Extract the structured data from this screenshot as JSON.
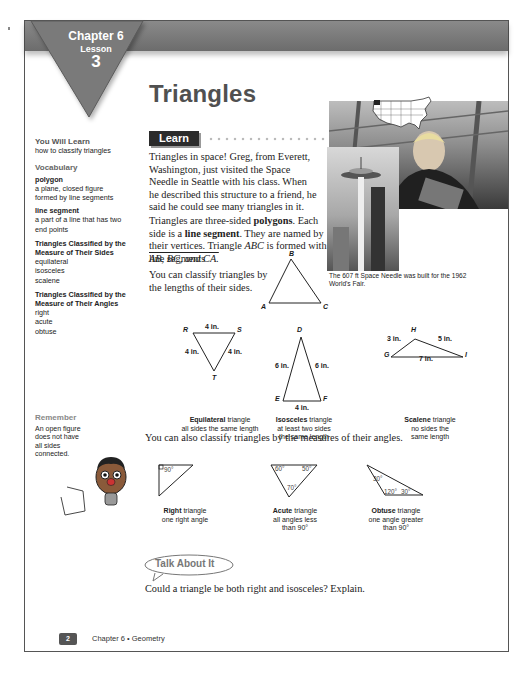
{
  "header": {
    "chapter": "Chapter 6",
    "lesson_label": "Lesson",
    "lesson_number": "3",
    "title": "Triangles"
  },
  "sidebar": {
    "will_learn_heading": "You Will Learn",
    "will_learn_text": "how to classify triangles",
    "vocab_heading": "Vocabulary",
    "terms": [
      {
        "term": "polygon",
        "definition": "a plane, closed figure formed by line segments"
      },
      {
        "term": "line segment",
        "definition": "a part of a line that has two end points"
      }
    ],
    "groups": [
      {
        "heading": "Triangles Classified by the Measure of Their Sides",
        "items": [
          "equilateral",
          "isosceles",
          "scalene"
        ]
      },
      {
        "heading": "Triangles Classified by the Measure of Their Angles",
        "items": [
          "right",
          "acute",
          "obtuse"
        ]
      }
    ],
    "remember_heading": "Remember",
    "remember_text": "An open figure does not have all sides connected."
  },
  "learn": {
    "label": "Learn",
    "para1": "Triangles in space! Greg, from Everett, Washington, just visited the Space Needle in Seattle with his class. When he described this structure to a friend, he said he could see many triangles in it.",
    "para2_a": "Triangles are three-sided ",
    "para2_b": "polygons",
    "para2_c": ". Each side is a ",
    "para2_d": "line segment",
    "para2_e": ". They are named by their vertices. Triangle ",
    "para2_f": "ABC",
    "para2_g": " is formed with line segments",
    "segments": "AB, BC, and CA.",
    "para3": "You can classify triangles by the lengths of their sides.",
    "photo_caption": "The 607 ft Space Needle was built for the 1962 World's Fair."
  },
  "triangle_abc": {
    "a": "A",
    "b": "B",
    "c": "C"
  },
  "side_triangles": [
    {
      "name": "Equilateral",
      "desc1": " triangle",
      "desc2": "all sides the same length",
      "vertices": [
        "R",
        "S",
        "T"
      ],
      "sides": [
        "4 in.",
        "4 in.",
        "4 in."
      ]
    },
    {
      "name": "Isosceles",
      "desc1": " triangle",
      "desc2": "at least two sides",
      "desc3": "the same length",
      "vertices": [
        "D",
        "E",
        "F"
      ],
      "sides": [
        "6 in.",
        "6 in.",
        "4 in."
      ]
    },
    {
      "name": "Scalene",
      "desc1": " triangle",
      "desc2": "no sides the",
      "desc3": "same length",
      "vertices": [
        "H",
        "G",
        "I"
      ],
      "sides": [
        "3 in.",
        "5 in.",
        "7 in."
      ]
    }
  ],
  "angles_intro": "You can also classify triangles by the measures of their angles.",
  "angle_triangles": [
    {
      "name": "Right",
      "desc1": " triangle",
      "desc2": "one right angle",
      "angles": [
        "90°"
      ]
    },
    {
      "name": "Acute",
      "desc1": " triangle",
      "desc2": "all angles less",
      "desc3": "than 90°",
      "angles": [
        "60°",
        "50°",
        "70°"
      ]
    },
    {
      "name": "Obtuse",
      "desc1": " triangle",
      "desc2": "one angle greater",
      "desc3": "than 90°",
      "angles": [
        "30°",
        "120°",
        "30°"
      ]
    }
  ],
  "talk_about_it": {
    "label": "Talk About It",
    "question": "Could a triangle be both right and isosceles? Explain."
  },
  "footer": {
    "page_number": "2",
    "text": "Chapter 6 • Geometry"
  }
}
